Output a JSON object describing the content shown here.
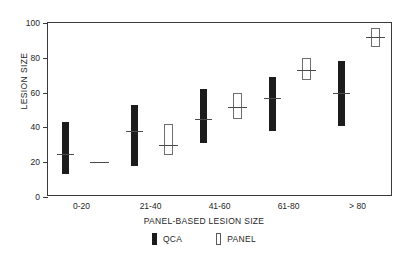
{
  "chart_data": {
    "type": "bar",
    "title": "",
    "xlabel": "PANEL-BASED LESION SIZE",
    "ylabel": "LESION SIZE",
    "categories": [
      "0-20",
      "21-40",
      "41-60",
      "61-80",
      "> 80"
    ],
    "ylim": [
      0,
      100
    ],
    "yticks": [
      0,
      20,
      40,
      60,
      80,
      100
    ],
    "grid": false,
    "legend_position": "below-axis",
    "series": [
      {
        "name": "QCA",
        "style": "filled-black-range-bar-with-median",
        "color": "#1c1c1c",
        "low": [
          13,
          18,
          31,
          38,
          41
        ],
        "high": [
          43,
          53,
          62,
          69,
          78
        ],
        "median": [
          25,
          38,
          45,
          57,
          60
        ]
      },
      {
        "name": "PANEL",
        "style": "hollow-white-range-bar-with-median",
        "color": "#ffffff",
        "edge_color": "#6e6e6e",
        "low": [
          20,
          24,
          45,
          67,
          86
        ],
        "high": [
          20,
          42,
          60,
          80,
          97
        ],
        "median": [
          20,
          30,
          52,
          73,
          92
        ]
      }
    ]
  },
  "legend": {
    "entries": [
      {
        "label": "QCA",
        "swatch": "filled"
      },
      {
        "label": "PANEL",
        "swatch": "hollow"
      }
    ]
  }
}
